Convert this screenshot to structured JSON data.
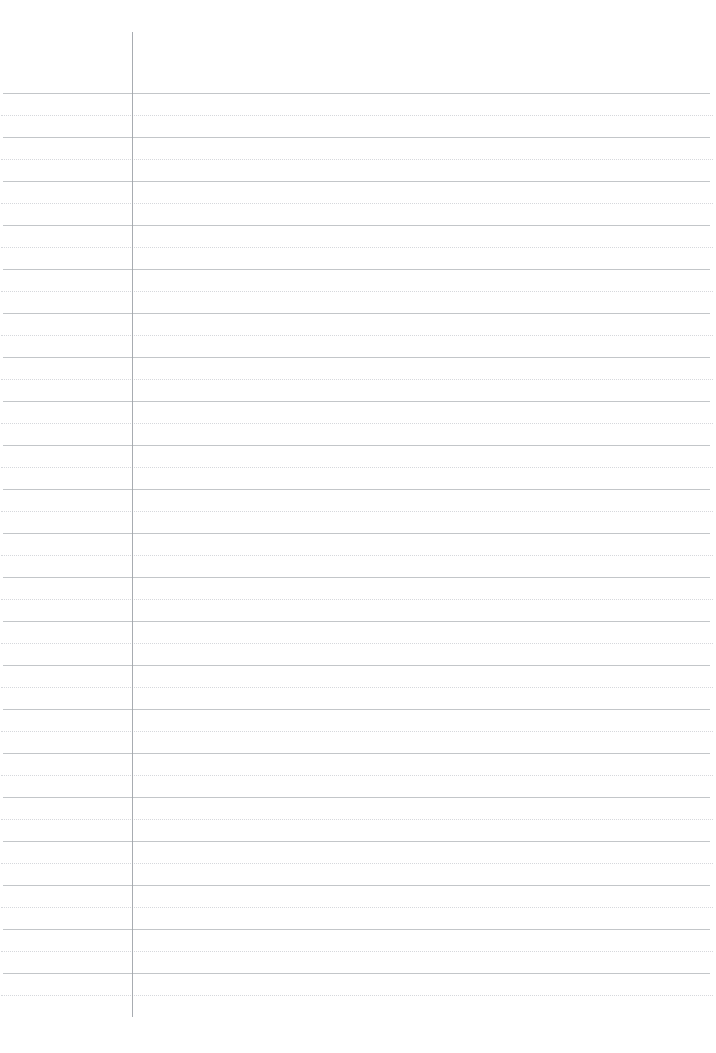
{
  "page": {
    "kind": "lined-notebook-paper",
    "width": 716,
    "height": 1053,
    "background_color": "#ffffff",
    "content_text": "",
    "is_blank": "true"
  },
  "ruling": {
    "solid_line_color": "#b9bcc0",
    "dotted_line_color": "#c9ccd1",
    "vertical_line_color": "#9fa3a8",
    "line_spacing_px": 44,
    "midline_offset_px": 22,
    "first_solid_line_y": 93,
    "last_solid_line_y": 993,
    "solid_line_count": 21,
    "dotted_line_count": 21,
    "horizontal_left_x": 3,
    "horizontal_right_x": 710,
    "dotted_left_x": 1,
    "dotted_right_x": 713,
    "vertical_line_x": 132,
    "vertical_line_top_y": 32,
    "vertical_line_bottom_y": 1017
  },
  "solid_lines_y": [
    93,
    137,
    181,
    225,
    269,
    313,
    357,
    401,
    445,
    489,
    533,
    577,
    621,
    665,
    709,
    753,
    797,
    841,
    885,
    929,
    973
  ],
  "dotted_lines_y": [
    115,
    159,
    203,
    247,
    291,
    335,
    379,
    423,
    467,
    511,
    555,
    599,
    643,
    687,
    731,
    775,
    819,
    863,
    907,
    951,
    995
  ]
}
